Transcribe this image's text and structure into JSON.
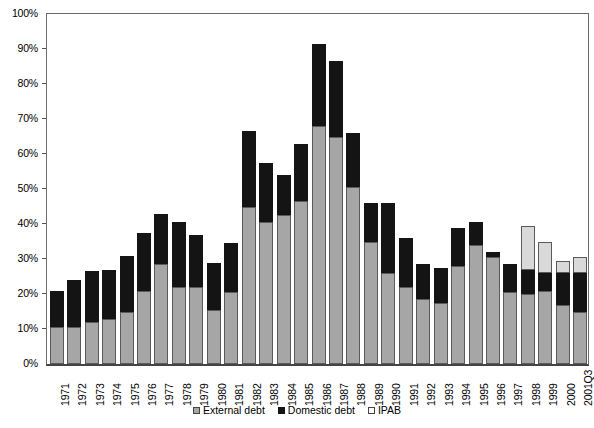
{
  "chart_data": {
    "type": "bar",
    "stacked": true,
    "title": "",
    "xlabel": "",
    "ylabel": "",
    "ylim": [
      0,
      100
    ],
    "y_unit": "%",
    "grid": false,
    "legend_position": "bottom",
    "y_ticks": [
      "0%",
      "10%",
      "20%",
      "30%",
      "40%",
      "50%",
      "60%",
      "70%",
      "80%",
      "90%",
      "100%"
    ],
    "y_tick_values": [
      0,
      10,
      20,
      30,
      40,
      50,
      60,
      70,
      80,
      90,
      100
    ],
    "categories": [
      "1971",
      "1972",
      "1973",
      "1974",
      "1975",
      "1976",
      "1977",
      "1978",
      "1979",
      "1980",
      "1981",
      "1982",
      "1983",
      "1984",
      "1985",
      "1986",
      "1987",
      "1988",
      "1989",
      "1990",
      "1991",
      "1992",
      "1993",
      "1994",
      "1995",
      "1996",
      "1997",
      "1998",
      "1999",
      "2000",
      "2001Q3"
    ],
    "series": [
      {
        "name": "External debt",
        "color": "#a6a6a6",
        "values": [
          10.5,
          10.5,
          12.0,
          13.0,
          15.0,
          21.0,
          28.5,
          22.0,
          22.0,
          15.5,
          20.5,
          45.0,
          40.5,
          42.5,
          46.5,
          68.0,
          65.0,
          50.5,
          35.0,
          26.0,
          22.0,
          18.5,
          17.5,
          28.0,
          34.0,
          30.5,
          20.5,
          20.0,
          21.0,
          17.0,
          15.0
        ]
      },
      {
        "name": "Domestic debt",
        "color": "#141414",
        "values": [
          10.5,
          13.5,
          14.5,
          14.0,
          16.0,
          16.5,
          14.5,
          18.5,
          15.0,
          13.5,
          14.0,
          21.5,
          17.0,
          11.5,
          16.5,
          23.5,
          21.5,
          15.5,
          11.0,
          20.0,
          14.0,
          10.0,
          10.0,
          11.0,
          6.5,
          1.5,
          8.0,
          7.0,
          5.0,
          9.0,
          11.0
        ]
      },
      {
        "name": "IPAB",
        "color": "#ffffff",
        "values": [
          0,
          0,
          0,
          0,
          0,
          0,
          0,
          0,
          0,
          0,
          0,
          0,
          0,
          0,
          0,
          0,
          0,
          0,
          0,
          0,
          0,
          0,
          0,
          0,
          0,
          0,
          0,
          12.5,
          9.0,
          3.5,
          4.5
        ]
      }
    ],
    "totals": [
      21.0,
      24.0,
      26.5,
      27.0,
      31.0,
      37.5,
      43.0,
      40.5,
      37.0,
      29.0,
      34.5,
      66.5,
      57.5,
      54.0,
      63.0,
      91.5,
      86.5,
      66.0,
      46.0,
      46.0,
      36.0,
      28.5,
      27.5,
      39.0,
      40.5,
      32.0,
      28.5,
      39.5,
      35.0,
      29.5,
      30.5
    ]
  },
  "legend": {
    "entries": [
      {
        "label": "External debt",
        "swatch": "gray-square-icon"
      },
      {
        "label": "Domestic debt",
        "swatch": "black-square-icon"
      },
      {
        "label": "IPAB",
        "swatch": "white-square-icon"
      }
    ]
  }
}
